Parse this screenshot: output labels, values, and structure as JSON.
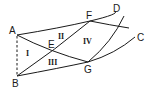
{
  "diagram": {
    "type": "geometric figure",
    "points": {
      "A": "A",
      "B": "B",
      "C": "C",
      "D": "D",
      "E": "E",
      "F": "F",
      "G": "G"
    },
    "regions": {
      "r1": "I",
      "r2": "II",
      "r3": "III",
      "r4": "IV"
    },
    "edges": [
      {
        "from": "A",
        "to": "B",
        "style": "dashed"
      },
      {
        "from": "A",
        "to": "D",
        "via": "F",
        "style": "solid-curve"
      },
      {
        "from": "B",
        "to": "C",
        "via": "G",
        "style": "solid-curve"
      },
      {
        "from": "A",
        "to": "G",
        "via": "E",
        "style": "solid"
      },
      {
        "from": "B",
        "to": "F",
        "via": "E",
        "style": "solid"
      },
      {
        "from": "F",
        "to": "right",
        "style": "solid-curve"
      },
      {
        "from": "G",
        "to": "top-right",
        "style": "solid-curve"
      }
    ]
  }
}
